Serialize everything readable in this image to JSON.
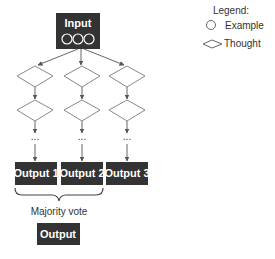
{
  "diagram": {
    "input": {
      "label": "Input",
      "example_count": 3
    },
    "columns": [
      {
        "id": 1,
        "output_label": "Output 1"
      },
      {
        "id": 2,
        "output_label": "Output 2"
      },
      {
        "id": 3,
        "output_label": "Output 3"
      }
    ],
    "ellipsis": "...",
    "aggregation_label": "Majority vote",
    "final_output_label": "Output"
  },
  "legend": {
    "title": "Legend:",
    "items": [
      {
        "shape": "circle",
        "label": "Example"
      },
      {
        "shape": "diamond",
        "label": "Thought"
      }
    ]
  },
  "colors": {
    "box_fill": "#333333",
    "box_text": "#ffffff",
    "line": "#666666",
    "diamond_stroke": "#888888"
  }
}
